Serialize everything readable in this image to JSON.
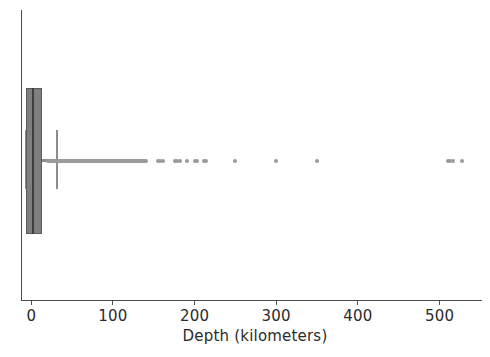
{
  "figure": {
    "background_color": "#ffffff",
    "axis_color": "#4d4d4d",
    "box_face_color": "#7f7f7f",
    "box_edge_color": "#5a5a5a",
    "median_color": "#3d3d3d",
    "whisker_color": "#8c8c8c",
    "flier_color": "#9a9a9a"
  },
  "axis": {
    "xlabel": "Depth (kilometers)",
    "ylabel": "",
    "title": "",
    "ticklabels": [
      "0",
      "100",
      "200",
      "300",
      "400",
      "500"
    ],
    "tickvalues": [
      0,
      100,
      200,
      300,
      400,
      500
    ],
    "xlim_min": -12,
    "xlim_max": 552,
    "grid": "off"
  },
  "chart_data": {
    "type": "box",
    "orientation": "horizontal",
    "title": "",
    "xlabel": "Depth (kilometers)",
    "ylabel": "",
    "xlim": [
      -12,
      552
    ],
    "xticks": [
      0,
      100,
      200,
      300,
      400,
      500
    ],
    "grid": false,
    "legend": "none",
    "boxes": [
      {
        "label": "Depth",
        "q1": -6,
        "median": 1,
        "q3": 13,
        "whisker_low": -6,
        "whisker_high": 31,
        "box_left_value": -6,
        "box_right_value": 13,
        "outliers": [
          20,
          22,
          24,
          25,
          26,
          27,
          28,
          29,
          30,
          31,
          32,
          33,
          34,
          35,
          36,
          37,
          38,
          39,
          40,
          41,
          42,
          43,
          44,
          45,
          46,
          47,
          48,
          49,
          50,
          51,
          52,
          53,
          54,
          55,
          56,
          57,
          58,
          59,
          60,
          61,
          62,
          63,
          64,
          65,
          66,
          67,
          68,
          69,
          70,
          71,
          72,
          73,
          74,
          75,
          76,
          77,
          78,
          79,
          80,
          81,
          82,
          83,
          84,
          85,
          86,
          87,
          88,
          89,
          90,
          91,
          92,
          93,
          94,
          95,
          96,
          97,
          98,
          99,
          100,
          101,
          102,
          103,
          104,
          105,
          106,
          107,
          108,
          109,
          110,
          111,
          112,
          113,
          114,
          115,
          116,
          117,
          118,
          119,
          120,
          121,
          122,
          123,
          124,
          125,
          126,
          127,
          128,
          129,
          130,
          131,
          132,
          133,
          134,
          135,
          136,
          137,
          138,
          139,
          140,
          155,
          158,
          161,
          176,
          179,
          182,
          191,
          200,
          203,
          211,
          214,
          250,
          300,
          350,
          510,
          513,
          516,
          528
        ]
      }
    ]
  }
}
